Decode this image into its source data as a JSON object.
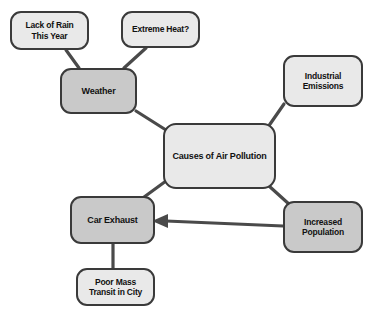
{
  "diagram": {
    "background_color": "#ffffff",
    "border_color": "#3a3a3a",
    "text_color": "#111111",
    "fill_dark": "#c9c9c9",
    "fill_light": "#e9e9e9",
    "nodes": [
      {
        "id": "lack-of-rain",
        "label": "Lack of Rain This Year",
        "line1": "Lack of Rain",
        "line2": "This Year",
        "fill": "light",
        "x": 10,
        "y": 11,
        "w": 79,
        "h": 39,
        "font_size": 8.5
      },
      {
        "id": "extreme-heat",
        "label": "Extreme Heat?",
        "line1": "Extreme Heat?",
        "line2": "",
        "fill": "light",
        "x": 121,
        "y": 11,
        "w": 79,
        "h": 37,
        "font_size": 8.5
      },
      {
        "id": "weather",
        "label": "Weather",
        "line1": "Weather",
        "line2": "",
        "fill": "dark",
        "x": 60,
        "y": 68,
        "w": 77,
        "h": 46,
        "font_size": 9
      },
      {
        "id": "industrial-emissions",
        "label": "Industrial Emissions",
        "line1": "Industrial",
        "line2": "Emissions",
        "fill": "light",
        "x": 283,
        "y": 55,
        "w": 80,
        "h": 52,
        "font_size": 8.5
      },
      {
        "id": "causes-of-air-pollution",
        "label": "Causes of Air Pollution",
        "line1": "Causes of Air Pollution",
        "line2": "",
        "fill": "light",
        "x": 163,
        "y": 123,
        "w": 113,
        "h": 66,
        "font_size": 9
      },
      {
        "id": "increased-population",
        "label": "Increased Population",
        "line1": "Increased",
        "line2": "Population",
        "fill": "dark",
        "x": 283,
        "y": 201,
        "w": 80,
        "h": 52,
        "font_size": 8.5
      },
      {
        "id": "car-exhaust",
        "label": "Car Exhaust",
        "line1": "Car Exhaust",
        "line2": "",
        "fill": "dark",
        "x": 70,
        "y": 196,
        "w": 85,
        "h": 48,
        "font_size": 9
      },
      {
        "id": "poor-mass-transit",
        "label": "Poor Mass Transit in City",
        "line1": "Poor Mass",
        "line2": "Transit in City",
        "fill": "light",
        "x": 76,
        "y": 268,
        "w": 79,
        "h": 38,
        "font_size": 8.5
      }
    ],
    "edges": [
      {
        "id": "lack-of-rain-to-weather",
        "from": "lack-of-rain",
        "to": "weather",
        "arrow": false
      },
      {
        "id": "extreme-heat-to-weather",
        "from": "extreme-heat",
        "to": "weather",
        "arrow": false
      },
      {
        "id": "weather-to-causes",
        "from": "weather",
        "to": "causes-of-air-pollution",
        "arrow": false
      },
      {
        "id": "industrial-emissions-to-causes",
        "from": "industrial-emissions",
        "to": "causes-of-air-pollution",
        "arrow": false
      },
      {
        "id": "causes-to-increased-population",
        "from": "causes-of-air-pollution",
        "to": "increased-population",
        "arrow": false
      },
      {
        "id": "causes-to-car-exhaust",
        "from": "causes-of-air-pollution",
        "to": "car-exhaust",
        "arrow": false
      },
      {
        "id": "increased-population-to-car-exhaust",
        "from": "increased-population",
        "to": "car-exhaust",
        "arrow": true
      },
      {
        "id": "car-exhaust-to-poor-mass-transit",
        "from": "car-exhaust",
        "to": "poor-mass-transit",
        "arrow": false
      }
    ]
  }
}
